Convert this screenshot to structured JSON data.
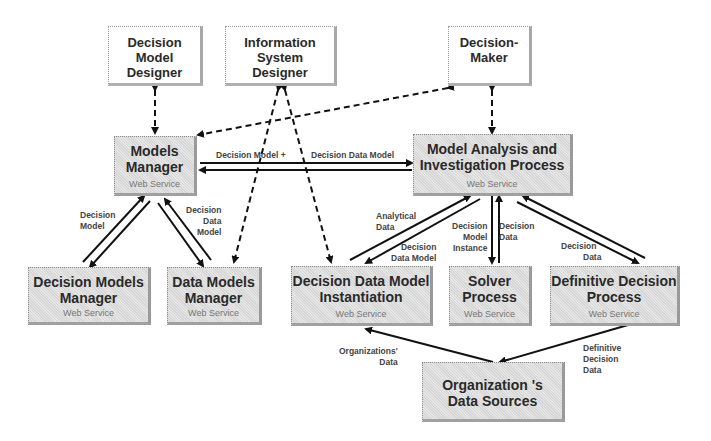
{
  "diagram": {
    "nodes": {
      "decision_model_designer": {
        "label": "Decision Model Designer",
        "lines": [
          "Decision",
          "Model",
          "Designer"
        ]
      },
      "information_system_designer": {
        "label": "Information System Designer",
        "lines": [
          "Information",
          "System",
          "Designer"
        ]
      },
      "decision_maker": {
        "label": "Decision-Maker",
        "lines": [
          "Decision-",
          "Maker"
        ]
      },
      "models_manager": {
        "lines": [
          "Models",
          "Manager"
        ],
        "subtitle": "Web Service"
      },
      "model_analysis": {
        "lines": [
          "Model Analysis and",
          "Investigation Process"
        ],
        "subtitle": "Web Service"
      },
      "decision_models_manager": {
        "lines": [
          "Decision Models",
          "Manager"
        ],
        "subtitle": "Web Service"
      },
      "data_models_manager": {
        "lines": [
          "Data Models",
          "Manager"
        ],
        "subtitle": "Web Service"
      },
      "decision_data_model_instantiation": {
        "lines": [
          "Decision Data Model",
          "Instantiation"
        ],
        "subtitle": "Web Service"
      },
      "solver_process": {
        "lines": [
          "Solver",
          "Process"
        ],
        "subtitle": "Web Service"
      },
      "definitive_decision_process": {
        "lines": [
          "Definitive Decision",
          "Process"
        ],
        "subtitle": "Web Service"
      },
      "org_data_sources": {
        "lines": [
          "Organization 's",
          "Data Sources"
        ]
      }
    },
    "edge_labels": {
      "mm_to_ma_left": "Decision Model +",
      "mm_to_ma_right": "Decision Data Model",
      "dmm_decision_model": [
        "Decision",
        "Model"
      ],
      "datamm_decision_data_model": [
        "Decision",
        "Data",
        "Model"
      ],
      "analytical_data": [
        "Analytical",
        "Data"
      ],
      "ddmi_decision_data_model": [
        "Decision",
        "Data Model"
      ],
      "solver_dmi": [
        "Decision",
        "Model",
        "Instance"
      ],
      "solver_decision_data": [
        "Decision",
        "Data"
      ],
      "ddp_decision_data": [
        "Decision",
        "Data"
      ],
      "orgs_data": [
        "Organizations'",
        "Data"
      ],
      "definitive_decision_data": [
        "Definitive",
        "Decision",
        "Data"
      ]
    }
  }
}
